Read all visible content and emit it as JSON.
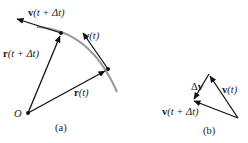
{
  "diagram_a": {
    "caption": "(a)",
    "origin_label": "O",
    "labels": {
      "v_next": {
        "vec": "v",
        "arg": "(t + Δt)"
      },
      "v_now": {
        "vec": "v",
        "arg": "(t)"
      },
      "r_next": {
        "vec": "r",
        "arg": "(t + Δt)"
      },
      "r_now": {
        "vec": "r",
        "arg": "(t)"
      }
    }
  },
  "diagram_b": {
    "caption": "(b)",
    "labels": {
      "delta_v": {
        "prefix": "Δ",
        "vec": "v"
      },
      "v_now": {
        "vec": "v",
        "arg": "(t)"
      },
      "v_next": {
        "vec": "v",
        "arg": "(t + Δt)"
      }
    }
  },
  "colors": {
    "vector": "#111111",
    "path": "#9a9a9a",
    "text": "#1a1a1a"
  }
}
